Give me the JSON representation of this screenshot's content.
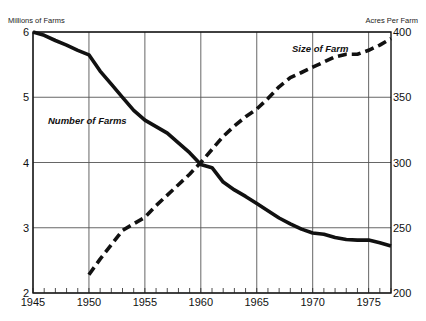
{
  "chart_data": {
    "type": "line",
    "title": "",
    "xlabel": "",
    "ylabel": "Millions of Farms",
    "ylabel_right": "Acres Per Farm",
    "xlim": [
      1945,
      1977
    ],
    "ylim": [
      2,
      6
    ],
    "ylim_right": [
      200,
      400
    ],
    "x_ticks": [
      1945,
      1950,
      1955,
      1960,
      1965,
      1970,
      1975
    ],
    "x_tick_labels": [
      "1945",
      "1950",
      "1955",
      "1960",
      "1965",
      "1970",
      "1975"
    ],
    "y_ticks": [
      2,
      3,
      4,
      5,
      6
    ],
    "y_tick_labels": [
      "2",
      "3",
      "4",
      "5",
      "6"
    ],
    "y_right_ticks": [
      200,
      250,
      300,
      350,
      400
    ],
    "y_right_tick_labels": [
      "200",
      "250",
      "300",
      "350",
      "400"
    ],
    "grid": true,
    "series": [
      {
        "name": "Number of Farms",
        "axis": "left",
        "style": "solid",
        "x": [
          1945,
          1946,
          1947,
          1948,
          1949,
          1950,
          1951,
          1952,
          1953,
          1954,
          1955,
          1956,
          1957,
          1958,
          1959,
          1960,
          1961,
          1962,
          1963,
          1964,
          1965,
          1966,
          1967,
          1968,
          1969,
          1970,
          1971,
          1972,
          1973,
          1974,
          1975,
          1976,
          1977
        ],
        "values": [
          6.0,
          5.95,
          5.87,
          5.8,
          5.72,
          5.65,
          5.4,
          5.2,
          5.0,
          4.8,
          4.65,
          4.55,
          4.45,
          4.3,
          4.15,
          3.97,
          3.92,
          3.7,
          3.58,
          3.48,
          3.37,
          3.26,
          3.15,
          3.06,
          2.98,
          2.92,
          2.9,
          2.85,
          2.82,
          2.81,
          2.81,
          2.77,
          2.72
        ]
      },
      {
        "name": "Size of Farm",
        "axis": "right",
        "style": "dashed",
        "x": [
          1950,
          1951,
          1952,
          1953,
          1954,
          1955,
          1956,
          1957,
          1958,
          1959,
          1960,
          1961,
          1962,
          1963,
          1964,
          1965,
          1966,
          1967,
          1968,
          1969,
          1970,
          1971,
          1972,
          1973,
          1974,
          1975,
          1976,
          1977
        ],
        "values": [
          214,
          226,
          237,
          248,
          253,
          258,
          267,
          275,
          283,
          291,
          300,
          310,
          320,
          328,
          335,
          341,
          349,
          358,
          365,
          369,
          373,
          377,
          381,
          383,
          383,
          386,
          390,
          395
        ]
      }
    ],
    "annotations": [
      {
        "text": "Number of Farms",
        "series": "Number of Farms"
      },
      {
        "text": "Size of Farm",
        "series": "Size of Farm"
      }
    ],
    "legend": "none"
  }
}
